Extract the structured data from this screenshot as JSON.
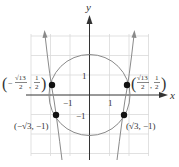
{
  "axes": {
    "x_label": "x",
    "y_label": "y",
    "ticks": {
      "x_pos": "1",
      "x_neg": "−1",
      "y_pos": "1",
      "y_neg": "−1"
    }
  },
  "points": [
    {
      "name": "upper-left",
      "label_open": "(",
      "sign": "−",
      "num": "√13",
      "den": "2",
      "comma": ",",
      "y_num": "1",
      "y_den": "2",
      "label_close": ")",
      "x": -1.8028,
      "y": 0.5
    },
    {
      "name": "upper-right",
      "label_open": "(",
      "sign": "",
      "num": "√13",
      "den": "2",
      "comma": ",",
      "y_num": "1",
      "y_den": "2",
      "label_close": ")",
      "x": 1.8028,
      "y": 0.5
    },
    {
      "name": "lower-left",
      "label": "(−√3, −1)",
      "x": -1.7321,
      "y": -1
    },
    {
      "name": "lower-right",
      "label": "(√3, −1)",
      "x": 1.7321,
      "y": -1
    }
  ],
  "curves": {
    "circle": {
      "center": [
        0,
        0
      ],
      "radius": 2
    },
    "branches": "two near-vertical curve branches with arrows, symmetric about y-axis"
  },
  "colors": {
    "axis": "#333333",
    "grid": "#d8d8d8",
    "curve": "#888888",
    "point": "#111111"
  }
}
